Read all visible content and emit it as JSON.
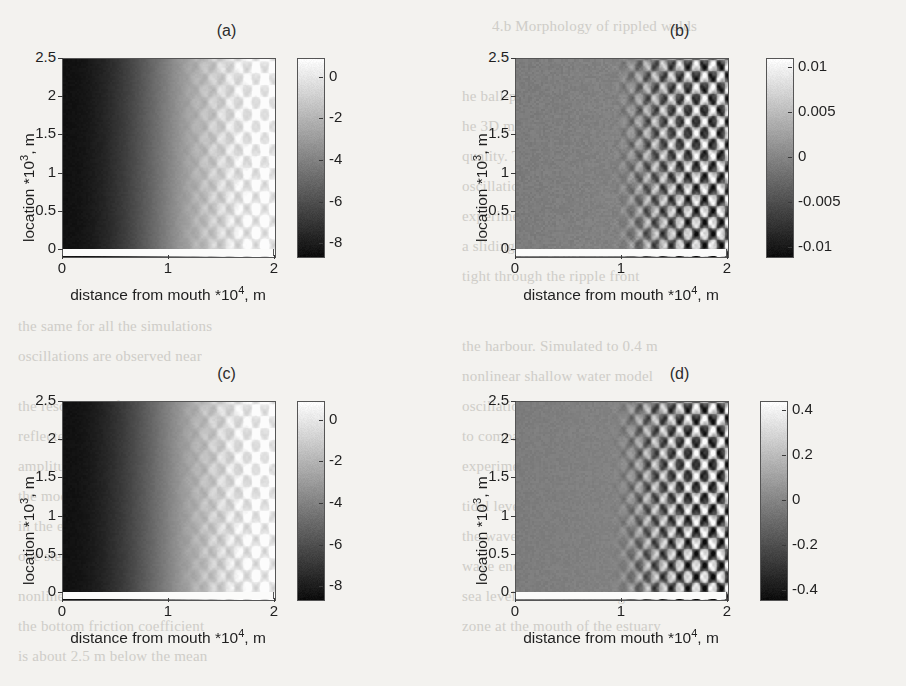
{
  "figure": {
    "background_color": "#f3f2ef",
    "panel_count": 4,
    "shared_xlabel_prefix": "distance from mouth *10",
    "shared_xlabel_exponent": "4",
    "shared_xlabel_suffix": ", m",
    "shared_ylabel_prefix": "location *10",
    "shared_ylabel_exponent": "3",
    "shared_ylabel_suffix": ", m"
  },
  "panels": [
    {
      "id": "a",
      "title": "(a)"
    },
    {
      "id": "b",
      "title": "(b)"
    },
    {
      "id": "c",
      "title": "(c)"
    },
    {
      "id": "d",
      "title": "(d)"
    }
  ],
  "ghost_text": [
    {
      "text": "4.b   Morphology of rippled welds",
      "x": 492,
      "y": 18
    },
    {
      "text": "he ball-pen tip on the hard surface",
      "x": 462,
      "y": 88
    },
    {
      "text": "he 3D model for the interaction of",
      "x": 462,
      "y": 118
    },
    {
      "text": "quality. The model predicts that a",
      "x": 462,
      "y": 148
    },
    {
      "text": "oscillation of the melt pool in the",
      "x": 462,
      "y": 178
    },
    {
      "text": "experimental set-up. Figure 1.6 (a)",
      "x": 462,
      "y": 208
    },
    {
      "text": "a sliding of the two amplitudes",
      "x": 462,
      "y": 238
    },
    {
      "text": "tight through the ripple front",
      "x": 462,
      "y": 268
    },
    {
      "text": "the harbour. Simulated to 0.4 m",
      "x": 462,
      "y": 338
    },
    {
      "text": "nonlinear shallow water model",
      "x": 462,
      "y": 368
    },
    {
      "text": "oscillation amplitude is reduced",
      "x": 462,
      "y": 398
    },
    {
      "text": "to compare with the tidal range",
      "x": 462,
      "y": 428
    },
    {
      "text": "experiment discussed above",
      "x": 462,
      "y": 458
    },
    {
      "text": "tidal level variation is small",
      "x": 462,
      "y": 498
    },
    {
      "text": "the wave-current interaction",
      "x": 462,
      "y": 528
    },
    {
      "text": "wave energy balance equation",
      "x": 462,
      "y": 558
    },
    {
      "text": "sea level interacted during a tide",
      "x": 462,
      "y": 588
    },
    {
      "text": "zone at the mouth of the estuary",
      "x": 462,
      "y": 618
    },
    {
      "text": "the same for all the simulations",
      "x": 18,
      "y": 318
    },
    {
      "text": "oscillations are observed near",
      "x": 18,
      "y": 348
    },
    {
      "text": "the resolution of the grid used",
      "x": 18,
      "y": 398
    },
    {
      "text": "reflected waves from the banks",
      "x": 18,
      "y": 428
    },
    {
      "text": "amplitude at the mouth is set",
      "x": 18,
      "y": 458
    },
    {
      "text": "the model gives stable results",
      "x": 18,
      "y": 488
    },
    {
      "text": "in the estuary the tidal wave is",
      "x": 18,
      "y": 518
    },
    {
      "text": "one step before and one step",
      "x": 18,
      "y": 548
    },
    {
      "text": "nonlinear terms are included",
      "x": 18,
      "y": 588
    },
    {
      "text": "the bottom friction coefficient",
      "x": 18,
      "y": 618
    },
    {
      "text": "is about 2.5 m below the mean",
      "x": 18,
      "y": 648
    }
  ],
  "axes": {
    "x": {
      "label_text": "distance from mouth *10",
      "exponent": "4",
      "label_tail": ", m",
      "ticks": [
        "0",
        "1",
        "2"
      ],
      "tick_values": [
        0,
        1,
        2
      ],
      "range": [
        0,
        2
      ],
      "unit": "m"
    },
    "y": {
      "label_text": "location *10",
      "exponent": "3",
      "label_tail": ", m",
      "ticks": [
        "2.5",
        "2",
        "1.5",
        "1",
        "0.5",
        "0"
      ],
      "tick_values": [
        2.5,
        2,
        1.5,
        1,
        0.5,
        0
      ],
      "range": [
        0,
        2.5
      ],
      "unit": "m"
    }
  },
  "chart_data": [
    {
      "id": "a",
      "type": "heatmap",
      "title": "(a)",
      "xlabel": "distance from mouth *10^4, m",
      "ylabel": "location *10^3, m",
      "xlim": [
        0,
        2
      ],
      "ylim": [
        0,
        2.5
      ],
      "zlim": [
        -8.6,
        0.9
      ],
      "colormap": "gray",
      "colorbar_ticks": [
        "0",
        "-2",
        "-4",
        "-6",
        "-8"
      ],
      "colorbar_tick_values": [
        0,
        -2,
        -4,
        -6,
        -8
      ],
      "description": "Mean water-depth / setup field: dark (about -8) along the left landward half, brightening toward 0 near the mouth at x=2, with a diamond lattice of crossing wave rays for x greater than about 1.0",
      "field": {
        "background_gradient": {
          "from": -8.4,
          "to": 0.6,
          "start_x": 0.0,
          "end_x": 2.0,
          "shape": "smoothstep"
        },
        "ray_amplitude": 0.95,
        "ray_onset_x": 1.0,
        "ray_wavelength_x": 0.165,
        "ray_wavelength_y": 0.3,
        "noise_amplitude": 0.22
      }
    },
    {
      "id": "b",
      "type": "heatmap",
      "title": "(b)",
      "xlabel": "distance from mouth *10^4, m",
      "ylabel": "location *10^3, m",
      "xlim": [
        0,
        2
      ],
      "ylim": [
        0,
        2.5
      ],
      "zlim": [
        -0.011,
        0.011
      ],
      "colormap": "gray",
      "colorbar_ticks": [
        "0.01",
        "0.005",
        "0",
        "-0.005",
        "-0.01"
      ],
      "colorbar_tick_values": [
        0.01,
        0.005,
        0,
        -0.005,
        -0.01
      ],
      "description": "Difference field, near zero (mid grey) everywhere with sharp crossing-wave ray structure between x of about 0.9 and 2.0; amplitude roughly plus or minus 0.008",
      "field": {
        "background_gradient": {
          "from": -0.0008,
          "to": 0.0006,
          "start_x": 0.0,
          "end_x": 2.0,
          "shape": "linear"
        },
        "ray_amplitude": 0.0085,
        "ray_onset_x": 0.85,
        "ray_wavelength_x": 0.155,
        "ray_wavelength_y": 0.285,
        "noise_amplitude": 0.0012
      }
    },
    {
      "id": "c",
      "type": "heatmap",
      "title": "(c)",
      "xlabel": "distance from mouth *10^4, m",
      "ylabel": "location *10^3, m",
      "xlim": [
        0,
        2
      ],
      "ylim": [
        0,
        2.5
      ],
      "zlim": [
        -8.6,
        0.9
      ],
      "colormap": "gray",
      "colorbar_ticks": [
        "0",
        "-2",
        "-4",
        "-6",
        "-8"
      ],
      "colorbar_tick_values": [
        0,
        -2,
        -4,
        -6,
        -8
      ],
      "description": "Same mean field as panel (a): dark landward, bright near the mouth, with diamond interference cells for x greater than about 1.0",
      "field": {
        "background_gradient": {
          "from": -8.4,
          "to": 0.6,
          "start_x": 0.0,
          "end_x": 2.0,
          "shape": "smoothstep"
        },
        "ray_amplitude": 0.95,
        "ray_onset_x": 1.0,
        "ray_wavelength_x": 0.165,
        "ray_wavelength_y": 0.3,
        "noise_amplitude": 0.22
      }
    },
    {
      "id": "d",
      "type": "heatmap",
      "title": "(d)",
      "xlabel": "distance from mouth *10^4, m",
      "ylabel": "location *10^3, m",
      "xlim": [
        0,
        2
      ],
      "ylim": [
        0,
        2.5
      ],
      "zlim": [
        -0.44,
        0.44
      ],
      "colormap": "gray",
      "colorbar_ticks": [
        "0.4",
        "0.2",
        "0",
        "-0.2",
        "-0.4"
      ],
      "colorbar_tick_values": [
        0.4,
        0.2,
        0,
        -0.2,
        -0.4
      ],
      "description": "Difference field with the same crossing-ray lattice as panel (b) but stronger contrast; amplitude roughly plus or minus 0.35 over a near-zero mid grey background",
      "field": {
        "background_gradient": {
          "from": -0.03,
          "to": 0.02,
          "start_x": 0.0,
          "end_x": 2.0,
          "shape": "linear"
        },
        "ray_amplitude": 0.36,
        "ray_onset_x": 0.85,
        "ray_wavelength_x": 0.155,
        "ray_wavelength_y": 0.285,
        "noise_amplitude": 0.035
      }
    }
  ]
}
